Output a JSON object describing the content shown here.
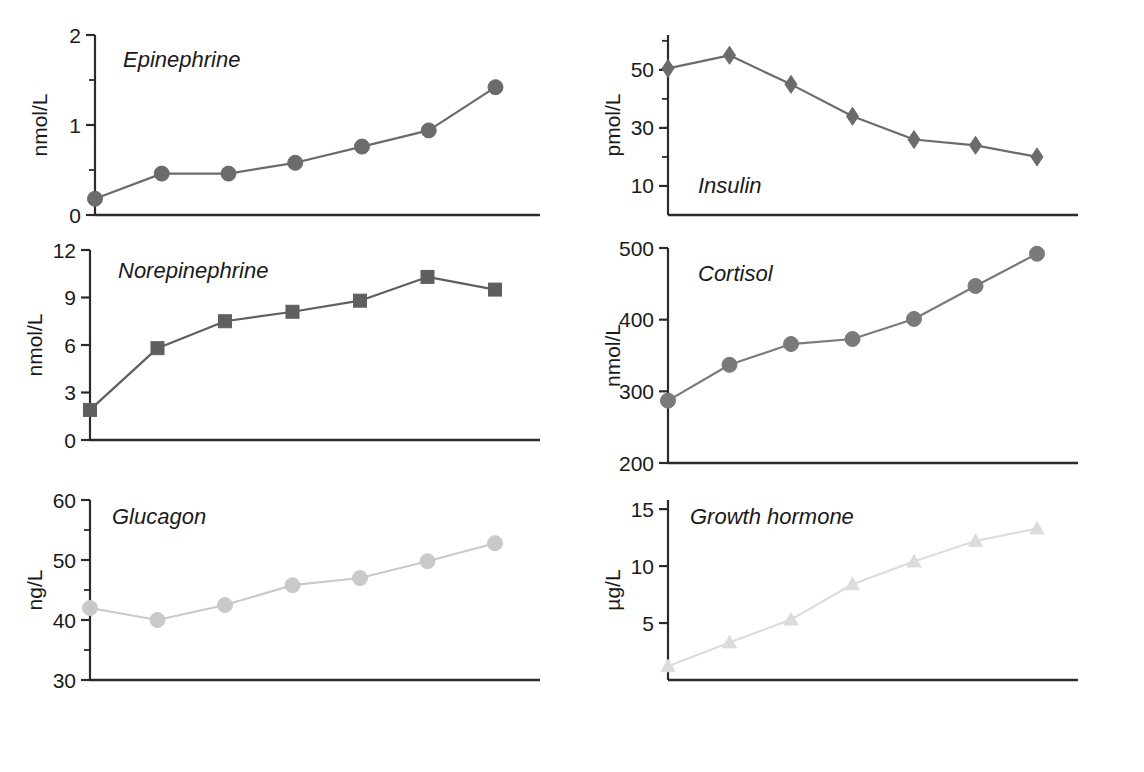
{
  "figure": {
    "background_color": "#ffffff",
    "axis_color": "#2b2b2b",
    "panel_count": 6
  },
  "shared": {
    "xlabel": "Minutes of exercise",
    "x_ticks": [
      0,
      20,
      40,
      60,
      80,
      100
    ],
    "x_tick_labels": [
      "0",
      "20",
      "40",
      "60",
      "80",
      "100"
    ],
    "x_minor_step": 10,
    "xlim": [
      0,
      100
    ],
    "x_points": [
      0,
      15,
      30,
      45,
      60,
      75,
      90
    ]
  },
  "chart_data": [
    {
      "id": "epinephrine",
      "type": "line",
      "title": "Epinephrine",
      "xlabel": "",
      "ylabel": "nmol/L",
      "x": [
        0,
        15,
        30,
        45,
        60,
        75,
        90
      ],
      "values": [
        0.18,
        0.46,
        0.46,
        0.58,
        0.76,
        0.94,
        1.42
      ],
      "xlim": [
        0,
        100
      ],
      "ylim": [
        0,
        2
      ],
      "y_ticks": [
        0,
        1,
        2
      ],
      "y_tick_labels": [
        "0",
        "1",
        "2"
      ],
      "y_minor_ticks": [
        0.5,
        1.5
      ],
      "marker": "circle",
      "color": "#6b6b6b",
      "grid": false,
      "legend": "none"
    },
    {
      "id": "insulin",
      "type": "line",
      "title": "Insulin",
      "xlabel": "",
      "ylabel": "pmol/L",
      "x": [
        0,
        15,
        30,
        45,
        60,
        75,
        90
      ],
      "values": [
        50.5,
        55.0,
        45.0,
        34.0,
        26.0,
        24.0,
        20.0
      ],
      "xlim": [
        0,
        100
      ],
      "ylim": [
        0,
        62
      ],
      "y_ticks": [
        10,
        30,
        50
      ],
      "y_tick_labels": [
        "10",
        "30",
        "50"
      ],
      "y_minor_ticks": [
        20,
        40,
        60
      ],
      "marker": "diamond",
      "color": "#6b6b6b",
      "grid": false,
      "legend": "none"
    },
    {
      "id": "norepinephrine",
      "type": "line",
      "title": "Norepinephrine",
      "xlabel": "",
      "ylabel": "nmol/L",
      "x": [
        0,
        15,
        30,
        45,
        60,
        75,
        90
      ],
      "values": [
        1.9,
        5.8,
        7.5,
        8.1,
        8.8,
        10.3,
        9.5
      ],
      "xlim": [
        0,
        100
      ],
      "ylim": [
        0,
        12
      ],
      "y_ticks": [
        0,
        3,
        6,
        9,
        12
      ],
      "y_tick_labels": [
        "0",
        "3",
        "6",
        "9",
        "12"
      ],
      "y_minor_ticks": [],
      "marker": "square",
      "color": "#5f5f5f",
      "grid": false,
      "legend": "none"
    },
    {
      "id": "cortisol",
      "type": "line",
      "title": "Cortisol",
      "xlabel": "",
      "ylabel": "nmol/L",
      "x": [
        0,
        15,
        30,
        45,
        60,
        75,
        90
      ],
      "values": [
        287,
        337,
        366,
        373,
        401,
        447,
        492
      ],
      "xlim": [
        0,
        100
      ],
      "ylim": [
        200,
        500
      ],
      "y_ticks": [
        200,
        300,
        400,
        500
      ],
      "y_tick_labels": [
        "200",
        "300",
        "400",
        "500"
      ],
      "y_minor_ticks": [],
      "marker": "circle",
      "color": "#7a7a7a",
      "grid": false,
      "legend": "none"
    },
    {
      "id": "glucagon",
      "type": "line",
      "title": "Glucagon",
      "xlabel": "Minutes of exercise",
      "ylabel": "ng/L",
      "x": [
        0,
        15,
        30,
        45,
        60,
        75,
        90
      ],
      "values": [
        42.0,
        40.0,
        42.5,
        45.8,
        47.0,
        49.8,
        52.8
      ],
      "xlim": [
        0,
        100
      ],
      "ylim": [
        30,
        60
      ],
      "y_ticks": [
        30,
        40,
        50,
        60
      ],
      "y_tick_labels": [
        "30",
        "40",
        "50",
        "60"
      ],
      "y_minor_ticks": [
        35,
        45,
        55
      ],
      "marker": "circle",
      "color": "#c9c9c9",
      "grid": false,
      "legend": "none"
    },
    {
      "id": "growth-hormone",
      "type": "line",
      "title": "Growth hormone",
      "xlabel": "Minutes of exercise",
      "ylabel": "µg/L",
      "x": [
        0,
        15,
        30,
        45,
        60,
        75,
        90
      ],
      "values": [
        1.2,
        3.3,
        5.3,
        8.4,
        10.4,
        12.2,
        13.3
      ],
      "xlim": [
        0,
        100
      ],
      "ylim": [
        0,
        15.8
      ],
      "y_ticks": [
        5,
        10,
        15
      ],
      "y_tick_labels": [
        "5",
        "10",
        "15"
      ],
      "y_minor_ticks": [],
      "marker": "triangle",
      "color": "#dcdcdc",
      "grid": false,
      "legend": "none"
    }
  ]
}
